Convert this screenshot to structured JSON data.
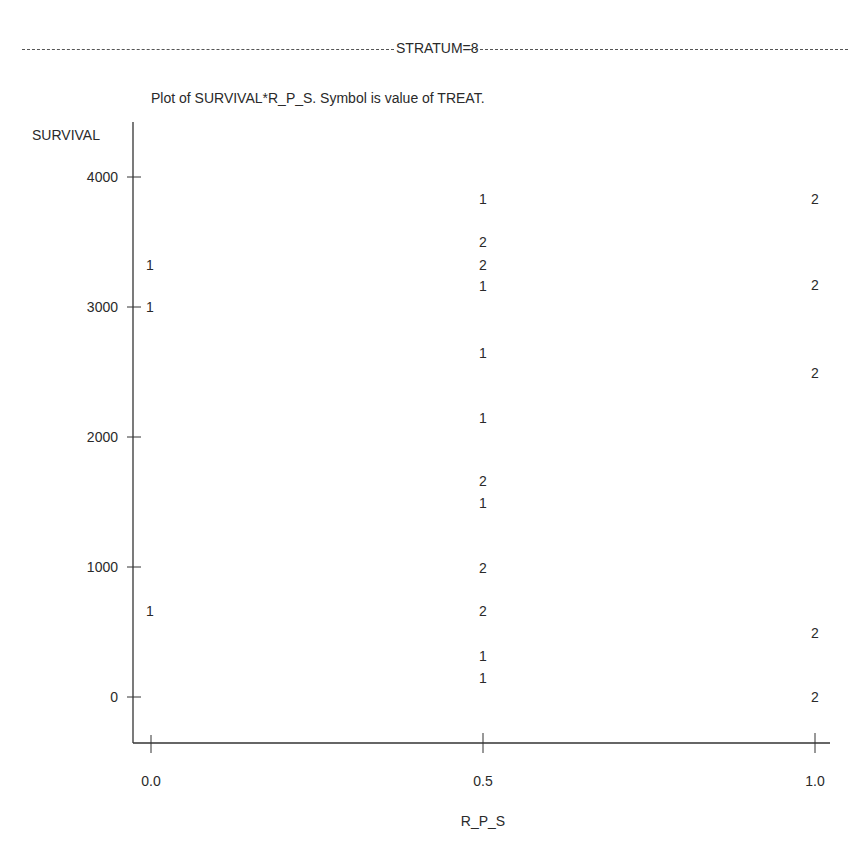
{
  "header": {
    "stratum_label": "STRATUM=8",
    "plot_title": "Plot of SURVIVAL*R_P_S.  Symbol is value of TREAT."
  },
  "chart_data": {
    "type": "scatter",
    "title": "Plot of SURVIVAL*R_P_S.  Symbol is value of TREAT.",
    "subtitle": "STRATUM=8",
    "xlabel": "R_P_S",
    "ylabel": "SURVIVAL",
    "x_ticks": [
      "0.0",
      "0.5",
      "1.0"
    ],
    "y_ticks": [
      "0",
      "1000",
      "2000",
      "3000",
      "4000"
    ],
    "xlim": [
      0.0,
      1.0
    ],
    "ylim": [
      -350,
      4350
    ],
    "grid": false,
    "legend": "Symbol is value of TREAT (1 or 2)",
    "series": [
      {
        "name": "TREAT=1",
        "symbol": "1",
        "points": [
          {
            "x": 0.0,
            "y": 3320
          },
          {
            "x": 0.0,
            "y": 3000
          },
          {
            "x": 0.0,
            "y": 660
          },
          {
            "x": 0.5,
            "y": 3830
          },
          {
            "x": 0.5,
            "y": 3160
          },
          {
            "x": 0.5,
            "y": 2650
          },
          {
            "x": 0.5,
            "y": 2150
          },
          {
            "x": 0.5,
            "y": 1490
          },
          {
            "x": 0.5,
            "y": 315
          },
          {
            "x": 0.5,
            "y": 145
          }
        ]
      },
      {
        "name": "TREAT=2",
        "symbol": "2",
        "points": [
          {
            "x": 0.5,
            "y": 3500
          },
          {
            "x": 0.5,
            "y": 3320
          },
          {
            "x": 0.5,
            "y": 1660
          },
          {
            "x": 0.5,
            "y": 990
          },
          {
            "x": 0.5,
            "y": 660
          },
          {
            "x": 1.0,
            "y": 3830
          },
          {
            "x": 1.0,
            "y": 3170
          },
          {
            "x": 1.0,
            "y": 2490
          },
          {
            "x": 1.0,
            "y": 490
          },
          {
            "x": 1.0,
            "y": 0
          }
        ]
      }
    ]
  }
}
